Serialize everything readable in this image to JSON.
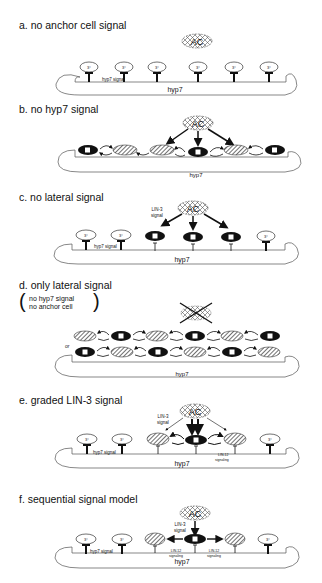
{
  "panels": [
    {
      "id": "a",
      "title": "a. no anchor cell signal",
      "labels": {
        "hyp7": "hyp7",
        "hyp7_signal": "hyp7 signal",
        "ac": "AC",
        "fate": "3°"
      }
    },
    {
      "id": "b",
      "title": "b. no hyp7 signal",
      "labels": {
        "hyp7": "hyp7",
        "ac": "AC"
      }
    },
    {
      "id": "c",
      "title": "c. no lateral signal",
      "labels": {
        "hyp7": "hyp7",
        "hyp7_signal": "hyp7 signal",
        "ac": "AC",
        "lin3": "LIN-3",
        "signal": "signal",
        "fate": "3°"
      }
    },
    {
      "id": "d",
      "title": "d. only lateral signal",
      "labels": {
        "hyp7": "hyp7",
        "or": "or",
        "note_line1": "no hyp7 signal",
        "note_line2": "no anchor cell"
      }
    },
    {
      "id": "e",
      "title": "e. graded LIN-3 signal",
      "labels": {
        "hyp7": "hyp7",
        "hyp7_signal": "hyp7 signal",
        "ac": "AC",
        "lin3": "LIN-3",
        "signal": "signal",
        "lin12": "LIN-12",
        "signaling": "signaling",
        "fate": "3°"
      }
    },
    {
      "id": "f",
      "title": "f. sequential  signal model",
      "labels": {
        "hyp7": "hyp7",
        "hyp7_signal": "hyp7 signal",
        "ac": "AC",
        "lin3": "LIN-3",
        "signal": "signal",
        "lin12": "LIN-12",
        "signaling": "signaling",
        "fate": "3°"
      }
    }
  ],
  "legend": {
    "primary_fate": "1°",
    "secondary_fate": "2°",
    "tertiary_fate": "3°"
  },
  "colors": {
    "primary_cell": "#111111",
    "outline": "#333333",
    "background": "#ffffff"
  }
}
